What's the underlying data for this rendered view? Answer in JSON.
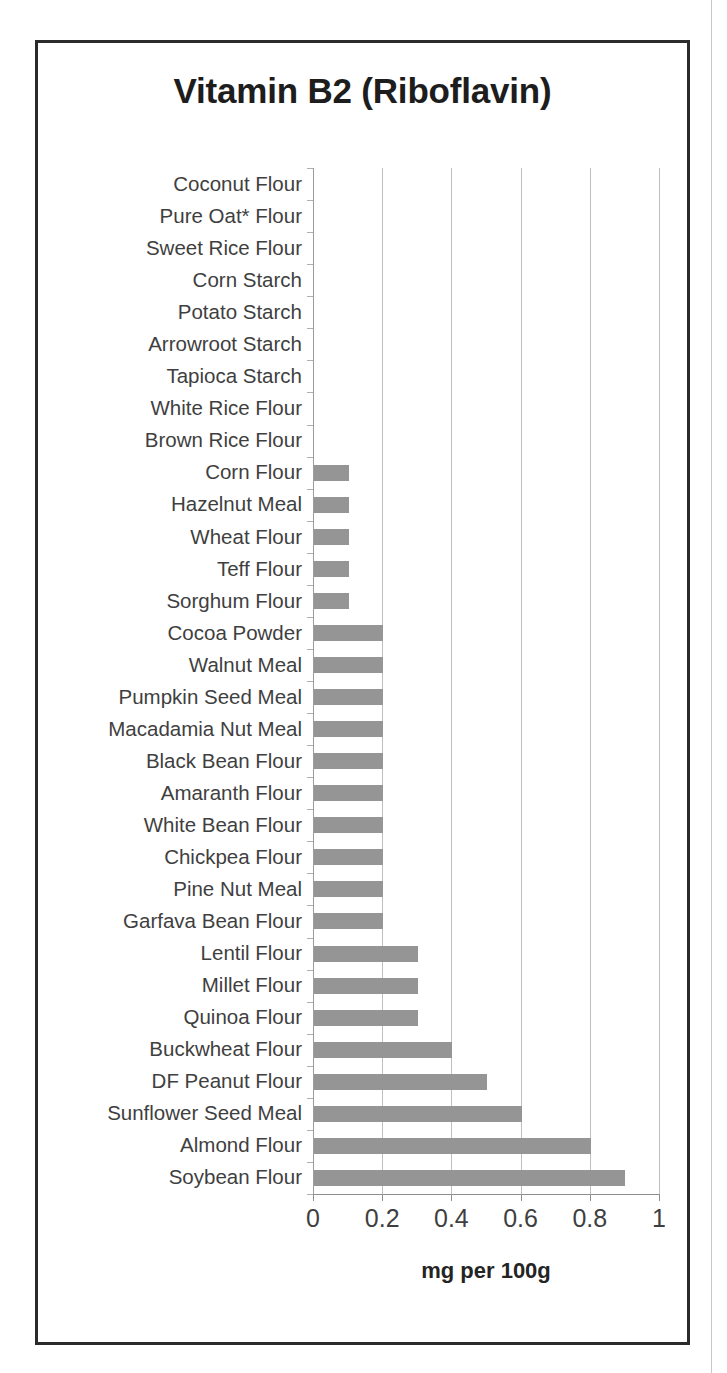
{
  "chart_data": {
    "type": "bar",
    "orientation": "horizontal",
    "title": "Vitamin B2 (Riboflavin)",
    "xlabel": "mg per 100g",
    "ylabel": "",
    "xlim": [
      0,
      1
    ],
    "xticks": [
      "0",
      "0.2",
      "0.4",
      "0.6",
      "0.8",
      "1"
    ],
    "xtick_values": [
      0,
      0.2,
      0.4,
      0.6,
      0.8,
      1
    ],
    "grid": true,
    "legend": null,
    "bar_color": "#959595",
    "categories": [
      "Coconut Flour",
      "Pure Oat* Flour",
      "Sweet Rice Flour",
      "Corn Starch",
      "Potato Starch",
      "Arrowroot Starch",
      "Tapioca Starch",
      "White Rice Flour",
      "Brown Rice Flour",
      "Corn Flour",
      "Hazelnut Meal",
      "Wheat Flour",
      "Teff Flour",
      "Sorghum Flour",
      "Cocoa Powder",
      "Walnut Meal",
      "Pumpkin Seed Meal",
      "Macadamia Nut Meal",
      "Black Bean Flour",
      "Amaranth Flour",
      "White Bean Flour",
      "Chickpea Flour",
      "Pine Nut Meal",
      "Garfava Bean Flour",
      "Lentil Flour",
      "Millet Flour",
      "Quinoa Flour",
      "Buckwheat Flour",
      "DF Peanut Flour",
      "Sunflower Seed Meal",
      "Almond Flour",
      "Soybean Flour"
    ],
    "values": [
      0,
      0,
      0,
      0,
      0,
      0,
      0,
      0,
      0,
      0.1,
      0.1,
      0.1,
      0.1,
      0.1,
      0.2,
      0.2,
      0.2,
      0.2,
      0.2,
      0.2,
      0.2,
      0.2,
      0.2,
      0.2,
      0.3,
      0.3,
      0.3,
      0.4,
      0.5,
      0.6,
      0.8,
      0.9
    ]
  }
}
